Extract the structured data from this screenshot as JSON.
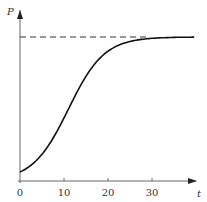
{
  "chart_data": {
    "type": "line",
    "title": "",
    "xlabel": "t",
    "ylabel": "P",
    "xlim": [
      0,
      40
    ],
    "ylim": [
      0,
      1.1
    ],
    "x_ticks": [
      0,
      10,
      20,
      30
    ],
    "x_tick_labels": [
      "0",
      "10",
      "20",
      "30"
    ],
    "y_ticks": [],
    "grid": false,
    "legend": null,
    "annotations": [
      {
        "type": "horizontal_dashed_line",
        "description": "carrying capacity asymptote",
        "y": 1.0
      }
    ],
    "series": [
      {
        "name": "P(t) logistic curve",
        "x": [
          0,
          2,
          4,
          6,
          8,
          10,
          12,
          14,
          16,
          18,
          20,
          22,
          24,
          26,
          28,
          30,
          32,
          34,
          36,
          38,
          40
        ],
        "values": [
          0.06,
          0.1,
          0.15,
          0.23,
          0.34,
          0.46,
          0.58,
          0.7,
          0.79,
          0.86,
          0.91,
          0.94,
          0.96,
          0.98,
          0.99,
          0.99,
          1.0,
          1.0,
          1.0,
          1.0,
          1.0
        ]
      }
    ]
  },
  "labels": {
    "y_axis": "P",
    "x_axis": "t",
    "ticks": [
      "0",
      "10",
      "20",
      "30"
    ]
  },
  "colors": {
    "axis": "#555555",
    "curve": "#111111",
    "dash": "#333333"
  }
}
